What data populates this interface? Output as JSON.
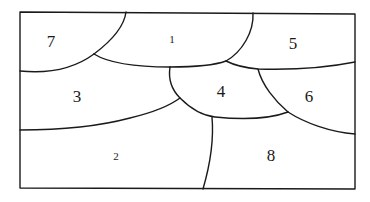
{
  "diagram": {
    "stroke_color": "#1a1a1a",
    "background": "#ffffff",
    "frame": {
      "x": 20,
      "y": 12,
      "width": 335,
      "height": 177
    },
    "regions": [
      {
        "id": "7",
        "label": "7",
        "x": 51,
        "y": 41,
        "size": "large"
      },
      {
        "id": "1",
        "label": "1",
        "x": 172,
        "y": 39,
        "size": "small"
      },
      {
        "id": "5",
        "label": "5",
        "x": 293,
        "y": 43,
        "size": "large"
      },
      {
        "id": "3",
        "label": "3",
        "x": 77,
        "y": 96,
        "size": "large"
      },
      {
        "id": "4",
        "label": "4",
        "x": 221,
        "y": 91,
        "size": "large"
      },
      {
        "id": "6",
        "label": "6",
        "x": 309,
        "y": 96,
        "size": "large"
      },
      {
        "id": "2",
        "label": "2",
        "x": 116,
        "y": 156,
        "size": "small"
      },
      {
        "id": "8",
        "label": "8",
        "x": 271,
        "y": 155,
        "size": "large"
      }
    ]
  }
}
